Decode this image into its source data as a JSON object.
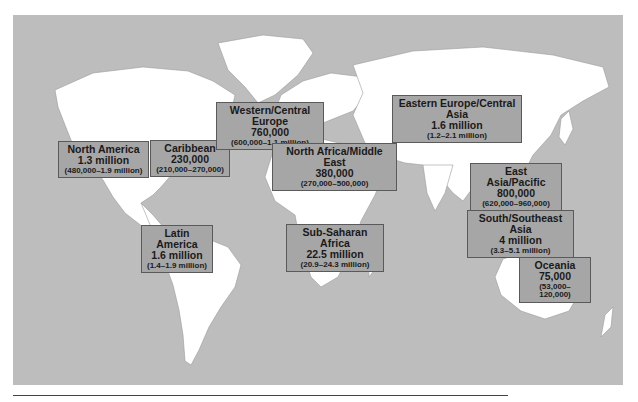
{
  "map": {
    "title": "",
    "background_color": "#bdbdbd",
    "land_color": "#ffffff",
    "label_box_color": "#a6a6a6"
  },
  "regions": [
    {
      "id": "north-america",
      "name": "North America",
      "value": "1.3 million",
      "range": "(480,000–1.9 million)"
    },
    {
      "id": "caribbean",
      "name": "Caribbean",
      "value": "230,000",
      "range": "(210,000–270,000)"
    },
    {
      "id": "latin-america",
      "name": "Latin America",
      "value": "1.6 million",
      "range": "(1.4–1.9 million)"
    },
    {
      "id": "western-central-europe",
      "name": "Western/Central Europe",
      "value": "760,000",
      "range": "(600,000–1.1 million)"
    },
    {
      "id": "north-africa-middle-east",
      "name": "North Africa/Middle East",
      "value": "380,000",
      "range": "(270,000–500,000)"
    },
    {
      "id": "sub-saharan-africa",
      "name": "Sub-Saharan Africa",
      "value": "22.5 million",
      "range": "(20.9–24.3 million)"
    },
    {
      "id": "eastern-europe-central-asia",
      "name": "Eastern Europe/Central Asia",
      "value": "1.6 million",
      "range": "(1.2–2.1 million)"
    },
    {
      "id": "east-asia-pacific",
      "name": "East Asia/Pacific",
      "value": "800,000",
      "range": "(620,000–960,000)"
    },
    {
      "id": "south-southeast-asia",
      "name": "South/Southeast Asia",
      "value": "4 million",
      "range": "(3.3–5.1 million)"
    },
    {
      "id": "oceania",
      "name": "Oceania",
      "value": "75,000",
      "range": "(53,000–120,000)"
    }
  ]
}
